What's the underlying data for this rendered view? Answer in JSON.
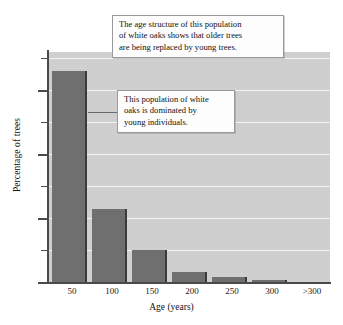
{
  "chart_data": {
    "type": "bar",
    "title": "",
    "xlabel": "Age (years)",
    "ylabel": "Percentage of trees",
    "categories": [
      "50",
      "100",
      "150",
      "200",
      "250",
      "300",
      ">300"
    ],
    "values": [
      66,
      23,
      10,
      3,
      1.5,
      0.7,
      0
    ],
    "ylim": [
      0,
      72
    ],
    "y_ticks_major": [
      0,
      20,
      40,
      60
    ],
    "y_tick_labels": [
      "0",
      "20",
      "40",
      "60"
    ],
    "y_ticks_minor": [
      10,
      30,
      50,
      70
    ],
    "grid": "horizontal-white-gridlines-every-10",
    "legend": "none",
    "bar_color": "#6f6f6f",
    "plot_background": "#cfcfcf",
    "annotations": [
      "The age structure of this population of white oaks shows that older trees are being replaced by young trees.",
      "This population of white oaks is dominated by young individuals."
    ]
  },
  "annotations": {
    "box1": {
      "line1": "The age structure of this population",
      "line2": "of white oaks shows that older trees",
      "line3": "are being replaced by young trees."
    },
    "box2": {
      "line1": "This population of white",
      "line2": "oaks is dominated by",
      "line3": "young individuals."
    }
  },
  "axes": {
    "y_title": "Percentage of trees",
    "x_title": "Age (years)",
    "y_labels": [
      "0",
      "20",
      "40",
      "60"
    ],
    "x_labels": [
      "50",
      "100",
      "150",
      "200",
      "250",
      "300",
      ">300"
    ]
  }
}
